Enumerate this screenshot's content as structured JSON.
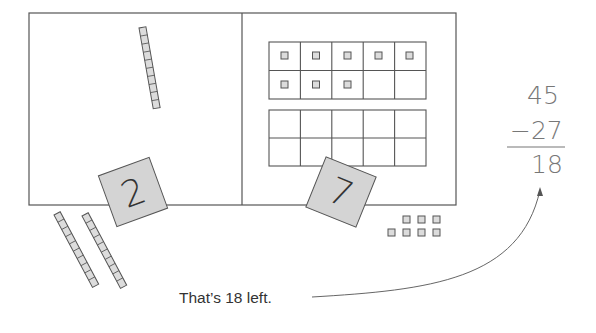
{
  "mat": {
    "left_section": {
      "label": "tens"
    },
    "right_section": {
      "label": "ones"
    }
  },
  "cards": [
    {
      "value": "2",
      "place": "tens"
    },
    {
      "value": "7",
      "place": "ones"
    }
  ],
  "blocks": {
    "tens_rods_on_mat": 1,
    "tens_rods_removed": 2,
    "ones_in_ten_frame": 8,
    "ones_removed": 7
  },
  "arithmetic": {
    "minuend": "45",
    "subtrahend": "−27",
    "difference": "18"
  },
  "caption": "That’s 18 left.",
  "colors": {
    "line": "#555555",
    "card_fill": "#d4d4d4",
    "block_fill": "#dcdcdc",
    "digit_text": "#777777"
  }
}
